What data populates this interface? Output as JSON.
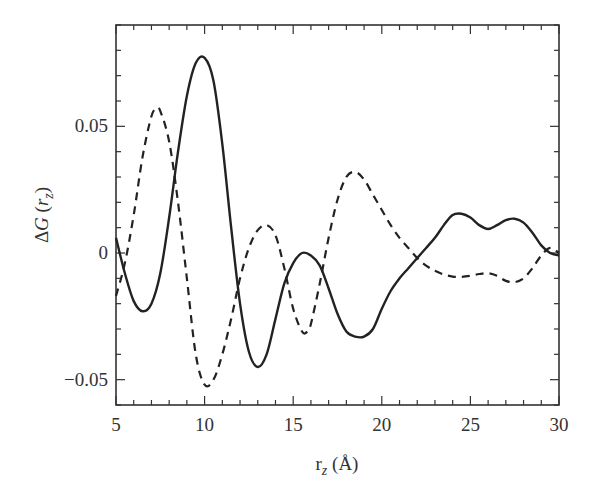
{
  "chart_data": {
    "type": "line",
    "title": "",
    "xlabel": "r_z (Å)",
    "ylabel": "ΔG(r_z)",
    "xlim": [
      5,
      30
    ],
    "ylim": [
      -0.06,
      0.09
    ],
    "xticks": [
      5,
      10,
      15,
      20,
      25,
      30
    ],
    "xtick_labels": [
      "5",
      "10",
      "15",
      "20",
      "25",
      "30"
    ],
    "yticks": [
      -0.05,
      0,
      0.05
    ],
    "ytick_labels": [
      "−0.05",
      "0",
      "0.05"
    ],
    "x_minor_step": 1,
    "y_minor_step": 0.01,
    "grid": false,
    "legend": null,
    "series": [
      {
        "name": "solid",
        "style": "solid",
        "color": "#222222",
        "x": [
          5,
          5.5,
          6,
          6.5,
          7,
          7.5,
          8,
          8.5,
          9,
          9.5,
          10,
          10.5,
          11,
          11.5,
          12,
          12.5,
          13,
          13.5,
          14,
          14.5,
          15,
          15.5,
          16,
          16.5,
          17,
          17.5,
          18,
          18.5,
          19,
          19.5,
          20,
          20.5,
          21,
          21.5,
          22,
          22.5,
          23,
          23.5,
          24,
          24.5,
          25,
          25.5,
          26,
          26.5,
          27,
          27.5,
          28,
          28.5,
          29,
          29.5,
          30
        ],
        "y": [
          0.006,
          -0.008,
          -0.019,
          -0.023,
          -0.02,
          -0.008,
          0.014,
          0.04,
          0.062,
          0.075,
          0.077,
          0.068,
          0.043,
          0.01,
          -0.02,
          -0.039,
          -0.045,
          -0.04,
          -0.026,
          -0.012,
          -0.004,
          0.0,
          -0.001,
          -0.005,
          -0.014,
          -0.024,
          -0.031,
          -0.033,
          -0.033,
          -0.03,
          -0.022,
          -0.015,
          -0.01,
          -0.006,
          -0.002,
          0.002,
          0.006,
          0.011,
          0.015,
          0.0155,
          0.014,
          0.011,
          0.0095,
          0.011,
          0.013,
          0.0135,
          0.012,
          0.008,
          0.003,
          0.0,
          -0.001
        ]
      },
      {
        "name": "dashed",
        "style": "dashed",
        "color": "#222222",
        "x": [
          5,
          5.5,
          6,
          6.5,
          7,
          7.3,
          7.5,
          8,
          8.5,
          9,
          9.5,
          10,
          10.5,
          11,
          11.5,
          12,
          12.5,
          13,
          13.5,
          14,
          14.5,
          15,
          15.5,
          15.8,
          16,
          16.5,
          17,
          17.5,
          18,
          18.5,
          19,
          19.5,
          20,
          20.5,
          21,
          21.5,
          22,
          22.5,
          23,
          23.5,
          24,
          24.5,
          25,
          25.5,
          26,
          26.5,
          27,
          27.5,
          28,
          28.5,
          29,
          29.5,
          30
        ],
        "y": [
          -0.017,
          -0.004,
          0.015,
          0.038,
          0.054,
          0.057,
          0.056,
          0.044,
          0.02,
          -0.01,
          -0.04,
          -0.052,
          -0.05,
          -0.04,
          -0.026,
          -0.01,
          0.002,
          0.009,
          0.011,
          0.007,
          -0.006,
          -0.022,
          -0.031,
          -0.031,
          -0.028,
          -0.012,
          0.006,
          0.021,
          0.03,
          0.032,
          0.029,
          0.023,
          0.017,
          0.011,
          0.006,
          0.002,
          -0.002,
          -0.005,
          -0.007,
          -0.0085,
          -0.0093,
          -0.0094,
          -0.009,
          -0.0083,
          -0.008,
          -0.009,
          -0.011,
          -0.0115,
          -0.01,
          -0.006,
          -0.001,
          0.002,
          0.0
        ]
      }
    ]
  }
}
